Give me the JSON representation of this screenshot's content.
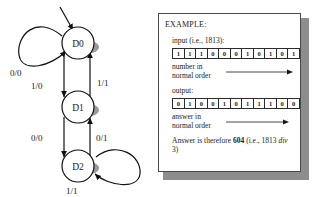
{
  "fsm": {
    "states": [
      {
        "id": "D0",
        "label": "D0"
      },
      {
        "id": "D1",
        "label": "D1"
      },
      {
        "id": "D2",
        "label": "D2"
      }
    ],
    "edge_labels": {
      "d0_self": "0/0",
      "d0_to_d1": "1/0",
      "d1_to_d0": "1/1",
      "d1_to_d2": "0/0",
      "d2_to_d1": "0/1",
      "d2_self": "1/1"
    }
  },
  "example": {
    "title": "EXAMPLE:",
    "input_label": "input (i.e., 1813):",
    "input_bits": [
      "1",
      "1",
      "1",
      "0",
      "0",
      "0",
      "1",
      "0",
      "1",
      "0",
      "1"
    ],
    "input_caption": "number in\nnormal order",
    "output_label": "output:",
    "output_bits": [
      "0",
      "1",
      "0",
      "0",
      "1",
      "0",
      "1",
      "1",
      "1",
      "0",
      "0"
    ],
    "output_caption": "answer in\nnormal order",
    "answer_prefix": "Answer is therefore ",
    "answer_value": "604",
    "answer_suffix_open": " (i.e., 1813 ",
    "answer_italic": "div",
    "answer_suffix_close": " 3)"
  }
}
